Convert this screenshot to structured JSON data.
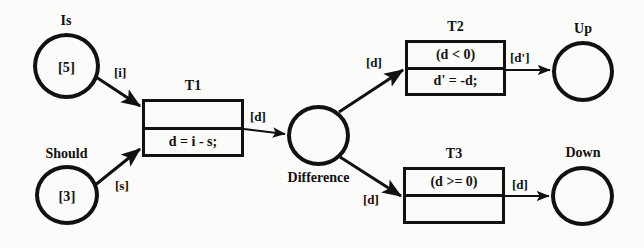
{
  "diagram": {
    "stroke_color": "#111111",
    "background_color": "#fbfbf9"
  },
  "places": [
    {
      "id": "is",
      "name": "Is",
      "token": "[5]"
    },
    {
      "id": "should",
      "name": "Should",
      "token": "[3]"
    },
    {
      "id": "difference",
      "name": "Difference",
      "token": ""
    },
    {
      "id": "up",
      "name": "Up",
      "token": ""
    },
    {
      "id": "down",
      "name": "Down",
      "token": ""
    }
  ],
  "transitions": [
    {
      "id": "t1",
      "name": "T1",
      "guard": "",
      "action": "d = i - s;"
    },
    {
      "id": "t2",
      "name": "T2",
      "guard": "(d < 0)",
      "action": "d' = -d;"
    },
    {
      "id": "t3",
      "name": "T3",
      "guard": "(d >= 0)",
      "action": ""
    }
  ],
  "arcs": [
    {
      "id": "is-to-t1",
      "label": "[i]",
      "from": "is",
      "to": "t1"
    },
    {
      "id": "should-to-t1",
      "label": "[s]",
      "from": "should",
      "to": "t1"
    },
    {
      "id": "t1-to-difference",
      "label": "[d]",
      "from": "t1",
      "to": "difference"
    },
    {
      "id": "difference-to-t2",
      "label": "[d]",
      "from": "difference",
      "to": "t2"
    },
    {
      "id": "difference-to-t3",
      "label": "[d]",
      "from": "difference",
      "to": "t3"
    },
    {
      "id": "t2-to-up",
      "label": "[d']",
      "from": "t2",
      "to": "up"
    },
    {
      "id": "t3-to-down",
      "label": "[d]",
      "from": "t3",
      "to": "down"
    }
  ]
}
